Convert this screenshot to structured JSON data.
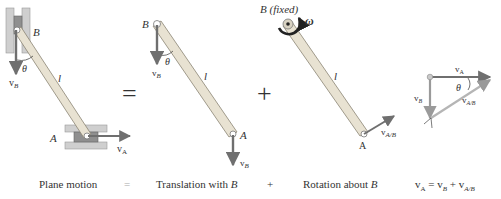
{
  "figure": {
    "panels": [
      {
        "id": "plane-motion",
        "caption": "Plane motion",
        "labels": {
          "point_top": "B",
          "point_bottom": "A",
          "length": "l",
          "angle": "θ",
          "vel_top": "v",
          "vel_top_sub": "B",
          "vel_bottom": "v",
          "vel_bottom_sub": "A"
        }
      },
      {
        "id": "translation",
        "caption": "Translation with B",
        "labels": {
          "point_top": "B",
          "point_bottom": "A",
          "length": "l",
          "angle": "θ",
          "vel_top": "v",
          "vel_top_sub": "B",
          "vel_bottom": "v",
          "vel_bottom_sub": "B"
        }
      },
      {
        "id": "rotation",
        "caption": "Rotation about B",
        "labels": {
          "point_top": "B (fixed)",
          "point_bottom": "A",
          "length": "l",
          "omega": "ω",
          "vel_bottom": "v",
          "vel_bottom_sub": "A/B"
        }
      },
      {
        "id": "vector-triangle",
        "caption": "vA = vB + vA/B",
        "labels": {
          "top": "v",
          "top_sub": "A",
          "left": "v",
          "left_sub": "B",
          "hyp": "v",
          "hyp_sub": "A/B",
          "angle": "θ"
        }
      }
    ],
    "operators": {
      "equals": "=",
      "plus": "+"
    },
    "caption_operators": {
      "equals": "=",
      "plus": "+"
    },
    "captions": {
      "plane": "Plane motion",
      "eq": "=",
      "translation_prefix": "Translation with ",
      "translation_var": "B",
      "plus": "+",
      "rotation_prefix": "Rotation about ",
      "rotation_var": "B",
      "equation": "v",
      "eq_sub1": "A",
      "eq_mid1": " = v",
      "eq_sub2": "B",
      "eq_mid2": " + v",
      "eq_sub3": "A/B"
    },
    "colors": {
      "bar_fill": "#e8e2d2",
      "bar_stroke": "#8a8474",
      "vector": "#707070",
      "guide": "#a8a8a8",
      "omega": "#222222"
    }
  }
}
